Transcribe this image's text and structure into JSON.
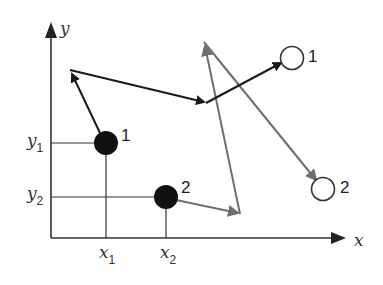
{
  "diagram": {
    "axes": {
      "x_label": "x",
      "y_label": "y",
      "x_ticks": [
        {
          "base": "x",
          "sub": "1"
        },
        {
          "base": "x",
          "sub": "2"
        }
      ],
      "y_ticks": [
        {
          "base": "y",
          "sub": "1"
        },
        {
          "base": "y",
          "sub": "2"
        }
      ]
    },
    "particles_initial": [
      {
        "label": "1",
        "style": "filled"
      },
      {
        "label": "2",
        "style": "filled"
      }
    ],
    "particles_final": [
      {
        "label": "1",
        "style": "open"
      },
      {
        "label": "2",
        "style": "open"
      }
    ],
    "paths": [
      {
        "particle": "1",
        "color": "#1a1a1a",
        "segments": 3
      },
      {
        "particle": "2",
        "color": "#6e6e6e",
        "segments": 3
      }
    ],
    "colors": {
      "axis": "#333333",
      "path1": "#1a1a1a",
      "path2": "#6e6e6e",
      "particle_fill": "#111111"
    }
  }
}
